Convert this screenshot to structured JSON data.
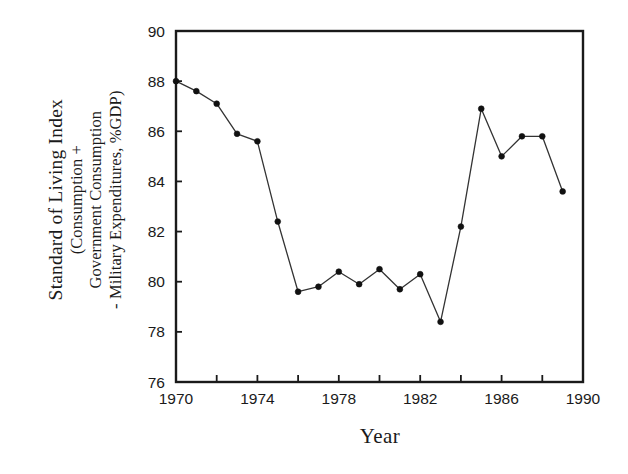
{
  "chart_data": {
    "type": "line",
    "title": "",
    "xlabel": "Year",
    "ylabel": "Standard of Living Index (Consumption + Government Consumption - Military Expenditures, %GDP)",
    "ylabel_lines": [
      "Standard of Living Index",
      "(Consumption +",
      "Government Consumption",
      "- Military Expenditures, %GDP)"
    ],
    "xlim": [
      1970,
      1990
    ],
    "ylim": [
      76,
      90
    ],
    "xticks": [
      1970,
      1972,
      1974,
      1976,
      1978,
      1980,
      1982,
      1984,
      1986,
      1988,
      1990
    ],
    "xtick_labels": [
      "1970",
      "",
      "1974",
      "",
      "1978",
      "",
      "1982",
      "",
      "1986",
      "",
      "1990"
    ],
    "xtick_labels_shown": [
      "1970",
      "1974",
      "1978",
      "1982",
      "1986",
      "1990"
    ],
    "yticks": [
      76,
      78,
      80,
      82,
      84,
      86,
      88,
      90
    ],
    "ytick_labels": [
      "76",
      "78",
      "80",
      "82",
      "84",
      "86",
      "88",
      "90"
    ],
    "grid": false,
    "legend": false,
    "marker": "filled-circle",
    "line_color": "#333333",
    "marker_color": "#111111",
    "axis_color": "#1a1a1a",
    "background": "#ffffff",
    "x": [
      1970,
      1971,
      1972,
      1973,
      1974,
      1975,
      1976,
      1977,
      1978,
      1979,
      1980,
      1981,
      1982,
      1983,
      1984,
      1985,
      1986,
      1987,
      1988
    ],
    "values": [
      88.0,
      87.6,
      87.1,
      85.9,
      85.6,
      82.4,
      79.6,
      79.8,
      80.4,
      79.9,
      80.5,
      79.7,
      80.3,
      78.4,
      82.2,
      86.9,
      85.0,
      85.8,
      85.8
    ],
    "series": [
      {
        "name": "Standard of Living Index",
        "values": [
          88.0,
          87.6,
          87.1,
          85.9,
          85.6,
          82.4,
          79.6,
          79.8,
          80.4,
          79.9,
          80.5,
          79.7,
          80.3,
          78.4,
          82.2,
          86.9,
          85.0,
          85.8,
          85.8
        ]
      }
    ],
    "last_point_note": "final point 1989 at 83.6",
    "x_full": [
      1970,
      1971,
      1972,
      1973,
      1974,
      1975,
      1976,
      1977,
      1978,
      1979,
      1980,
      1981,
      1982,
      1983,
      1984,
      1985,
      1986,
      1987,
      1988,
      1989
    ],
    "values_full": [
      88.0,
      87.6,
      87.1,
      85.9,
      85.6,
      82.4,
      79.6,
      79.8,
      80.4,
      79.9,
      80.5,
      79.7,
      80.3,
      78.4,
      82.2,
      86.9,
      85.0,
      85.8,
      85.8,
      83.6
    ]
  }
}
